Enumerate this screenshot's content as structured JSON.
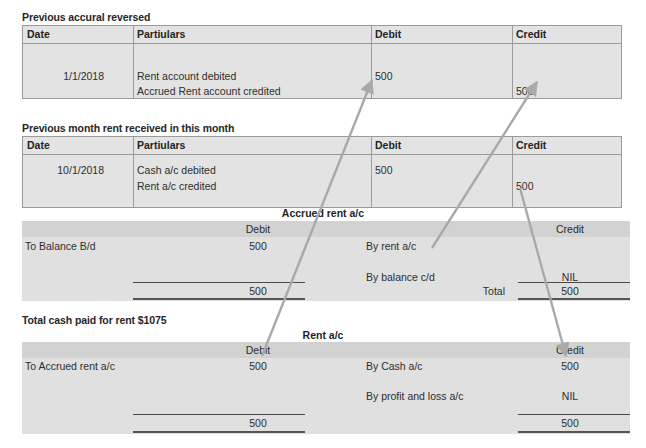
{
  "document": {
    "title": "Accrued rent accounting worked example"
  },
  "journals": [
    {
      "caption": "Previous accural reversed",
      "columns": [
        "Date",
        "Partiulars",
        "Debit",
        "Credit"
      ],
      "rows": [
        {
          "date": "1/1/2018",
          "particulars": "Rent account debited",
          "debit": "500",
          "credit": ""
        },
        {
          "date": "",
          "particulars": "Accrued Rent account credited",
          "debit": "",
          "credit": "500"
        }
      ]
    },
    {
      "caption": "Previous month rent received in this month",
      "columns": [
        "Date",
        "Partiulars",
        "Debit",
        "Credit"
      ],
      "rows": [
        {
          "date": "10/1/2018",
          "particulars": "Cash a/c debited",
          "debit": "500",
          "credit": ""
        },
        {
          "date": "",
          "particulars": "Rent a/c credited",
          "debit": "",
          "credit": "500"
        }
      ]
    }
  ],
  "ledgers": [
    {
      "title": "Accrued rent a/c",
      "debit_header": "Debit",
      "credit_header": "Credit",
      "debit_rows": [
        {
          "label": "To Balance B/d",
          "amount": "500"
        },
        {
          "label": "",
          "amount": ""
        }
      ],
      "credit_rows": [
        {
          "label": "By rent a/c",
          "amount": ""
        },
        {
          "label": "By balance c/d",
          "amount": "NIL"
        }
      ],
      "debit_total_label": "",
      "debit_total": "500",
      "credit_total_label": "Total",
      "credit_total": "500"
    },
    {
      "title": "Rent a/c",
      "debit_header": "Debit",
      "credit_header": "Credit",
      "debit_rows": [
        {
          "label": "To Accrued rent a/c",
          "amount": "500"
        },
        {
          "label": "",
          "amount": ""
        }
      ],
      "credit_rows": [
        {
          "label": "By Cash a/c",
          "amount": "500"
        },
        {
          "label": "By profit and loss a/c",
          "amount": "NIL"
        }
      ],
      "debit_total_label": "",
      "debit_total": "500",
      "credit_total_label": "",
      "credit_total": "500"
    }
  ],
  "notes": {
    "total_cash_paid": "Total cash paid for rent $1075"
  },
  "colors": {
    "table_fill": "#e3e3e3",
    "band_fill": "#d2d2d2",
    "border": "#9a9a9a",
    "rule": "#4a4a4a",
    "arrow": "#a6a6a6",
    "text": "#2b2b2b"
  }
}
